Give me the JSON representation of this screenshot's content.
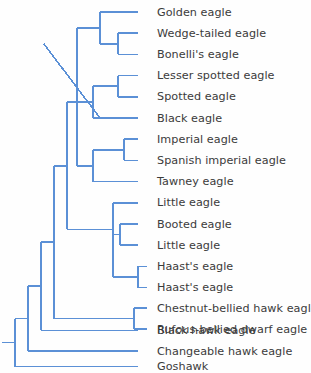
{
  "figure": {
    "name": "phylogenetic-tree-of-booted-eagles",
    "type": "cladogram",
    "orientation": "left-to-right",
    "background_color": "#fefefe",
    "branch_color": "#5b90d6",
    "label_color": "#3b3b3b",
    "branch_width_px": 1.6,
    "tip_count": 17,
    "outgroup": "Goshawk"
  },
  "taxa": [
    {
      "index": 0,
      "label": "Golden eagle",
      "tip_y": 12,
      "branch_x": 138
    },
    {
      "index": 1,
      "label": "Wedge-tailed eagle",
      "tip_y": 33,
      "branch_x": 138
    },
    {
      "index": 2,
      "label": "Bonelli's eagle",
      "tip_y": 54,
      "branch_x": 138
    },
    {
      "index": 3,
      "label": "Lesser spotted eagle",
      "tip_y": 76,
      "branch_x": 138
    },
    {
      "index": 4,
      "label": "Spotted eagle",
      "tip_y": 97,
      "branch_x": 138
    },
    {
      "index": 5,
      "label": "Black eagle",
      "tip_y": 118,
      "branch_x": 138
    },
    {
      "index": 6,
      "label": "Imperial eagle",
      "tip_y": 139,
      "branch_x": 138
    },
    {
      "index": 7,
      "label": "Spanish imperial eagle",
      "tip_y": 160,
      "branch_x": 138
    },
    {
      "index": 8,
      "label": "Tawney eagle",
      "tip_y": 181,
      "branch_x": 138
    },
    {
      "index": 9,
      "label": "Little eagle",
      "tip_y": 202,
      "branch_x": 138
    },
    {
      "index": 10,
      "label": "Booted eagle",
      "tip_y": 223,
      "branch_x": 138
    },
    {
      "index": 11,
      "label": "Little eagle",
      "tip_y": 244,
      "branch_x": 138
    },
    {
      "index": 12,
      "label": "Haast's eagle",
      "tip_y": 265,
      "branch_x": 146
    },
    {
      "index": 13,
      "label": "Haast's eagle",
      "tip_y": 286,
      "branch_x": 146
    },
    {
      "index": 14,
      "label": "Chestnut-bellied hawk eagle",
      "tip_y": 307,
      "branch_x": 146
    },
    {
      "index": 15,
      "label": "Rufous-bellied dwarf eagle",
      "tip_y": 328,
      "branch_x": 146
    },
    {
      "index": 16,
      "label": "Black hawk eagle",
      "tip_y": 349,
      "branch_x": 138
    },
    {
      "index": 17,
      "label": "Changeable hawk eagle",
      "tip_y": 367,
      "branch_x": 138
    },
    {
      "index": 18,
      "label": "Goshawk",
      "tip_y": 385,
      "branch_x": 138
    }
  ],
  "tip_rows": [
    {
      "label": "Golden eagle",
      "y": 12,
      "tip_x": 138,
      "style": "plain"
    },
    {
      "label": "Wedge-tailed eagle",
      "y": 33,
      "tip_x": 138,
      "style": "plain"
    },
    {
      "label": "Bonelli's eagle",
      "y": 55,
      "tip_x": 138,
      "style": "plain"
    },
    {
      "label": "Lesser spotted eagle",
      "y": 76,
      "tip_x": 138,
      "style": "plain"
    },
    {
      "label": "Spotted eagle",
      "y": 98,
      "tip_x": 138,
      "style": "plain"
    },
    {
      "label": "Black eagle",
      "y": 119,
      "tip_x": 138,
      "style": "plain"
    },
    {
      "label": "Imperial eagle",
      "y": 140,
      "tip_x": 138,
      "style": "plain"
    },
    {
      "label": "Spanish imperial eagle",
      "y": 162,
      "tip_x": 138,
      "style": "plain"
    },
    {
      "label": "Tawney eagle",
      "y": 183,
      "tip_x": 138,
      "style": "plain"
    },
    {
      "label": "Little eagle",
      "y": 204,
      "tip_x": 138,
      "style": "plain"
    },
    {
      "label": "Booted eagle",
      "y": 226,
      "tip_x": 138,
      "style": "plain"
    },
    {
      "label": "Little eagle",
      "y": 247,
      "tip_x": 138,
      "style": "plain"
    },
    {
      "label": "Haast's eagle",
      "y": 268,
      "tip_x": 147,
      "style": "short"
    },
    {
      "label": "Haast's eagle",
      "y": 290,
      "tip_x": 147,
      "style": "short"
    },
    {
      "label": "Chestnut-bellied hawk eagle",
      "y": 311,
      "tip_x": 147,
      "style": "short"
    },
    {
      "label": "Rufous-bellied dwarf eagle",
      "y": 332,
      "tip_x": 147,
      "style": "short"
    },
    {
      "label": "Black hawk eagle",
      "y": 330,
      "tip_x": 138,
      "style": "plain"
    },
    {
      "label": "Changeable hawk eagle",
      "y": 351,
      "tip_x": 138,
      "style": "plain"
    },
    {
      "label": "Goshawk",
      "y": 367,
      "tip_x": 138,
      "style": "plain"
    }
  ],
  "chart_data": {
    "type": "tree",
    "title": "",
    "leaf_labels": [
      "Golden eagle",
      "Wedge-tailed eagle",
      "Bonelli's eagle",
      "Lesser spotted eagle",
      "Spotted eagle",
      "Black eagle",
      "Imperial eagle",
      "Spanish imperial eagle",
      "Tawney eagle",
      "Little eagle",
      "Booted eagle",
      "Little eagle",
      "Haast's eagle",
      "Haast's eagle",
      "Chestnut-bellied hawk eagle",
      "Rufous-bellied dwarf eagle",
      "Black hawk eagle",
      "Changeable hawk eagle",
      "Goshawk"
    ],
    "newick": "(((((((Golden eagle,(Wedge-tailed eagle,Bonelli's eagle)),((Lesser spotted eagle,Spotted eagle),Black eagle),((Imperial eagle,Spanish imperial eagle),Tawney eagle)),(Little eagle,((Booted eagle,Little eagle),(Haast's eagle,Haast's eagle)))),(Chestnut-bellied hawk eagle,Rufous-bellied dwarf eagle)),Black hawk eagle),Changeable hawk eagle),Goshawk);",
    "clades": [
      {
        "name": "golden-eagle-clade",
        "members": [
          "Golden eagle",
          "Wedge-tailed eagle",
          "Bonelli's eagle"
        ]
      },
      {
        "name": "wedge-bonelli-pair",
        "members": [
          "Wedge-tailed eagle",
          "Bonelli's eagle"
        ]
      },
      {
        "name": "spotted-eagle-clade",
        "members": [
          "Lesser spotted eagle",
          "Spotted eagle",
          "Black eagle"
        ]
      },
      {
        "name": "lesser-spotted-pair",
        "members": [
          "Lesser spotted eagle",
          "Spotted eagle"
        ]
      },
      {
        "name": "imperial-eagle-clade",
        "members": [
          "Imperial eagle",
          "Spanish imperial eagle",
          "Tawney eagle"
        ]
      },
      {
        "name": "imperial-pair",
        "members": [
          "Imperial eagle",
          "Spanish imperial eagle"
        ]
      },
      {
        "name": "little-eagle-clade",
        "members": [
          "Little eagle",
          "Booted eagle",
          "Little eagle",
          "Haast's eagle",
          "Haast's eagle"
        ]
      },
      {
        "name": "booted-little-pair",
        "members": [
          "Booted eagle",
          "Little eagle"
        ]
      },
      {
        "name": "haasts-pair",
        "members": [
          "Haast's eagle",
          "Haast's eagle"
        ]
      },
      {
        "name": "chestnut-rufous-pair",
        "members": [
          "Chestnut-bellied hawk eagle",
          "Rufous-bellied dwarf eagle"
        ]
      }
    ],
    "x_axis": "no scale shown",
    "grid": false,
    "legend": "none"
  },
  "geometry": {
    "label_x": 157,
    "tip_x_long": 138,
    "tip_x_short": 147,
    "root_x": 15,
    "node_x": {
      "root": 15,
      "changeable_split": 28,
      "blackhawk_split": 41,
      "chestnut_split": 54,
      "chestnut_pair": 134,
      "booted_group": 67,
      "core_aquila": 77,
      "golden_clade": 100,
      "wedge_pair": 118,
      "spotted_clade": 93,
      "lesser_pair": 118,
      "imperial_clade": 93,
      "imperial_pair": 124,
      "little_clade": 113,
      "booted_pair": 120,
      "haasts_clade": 113,
      "haasts_pair": 138
    }
  }
}
